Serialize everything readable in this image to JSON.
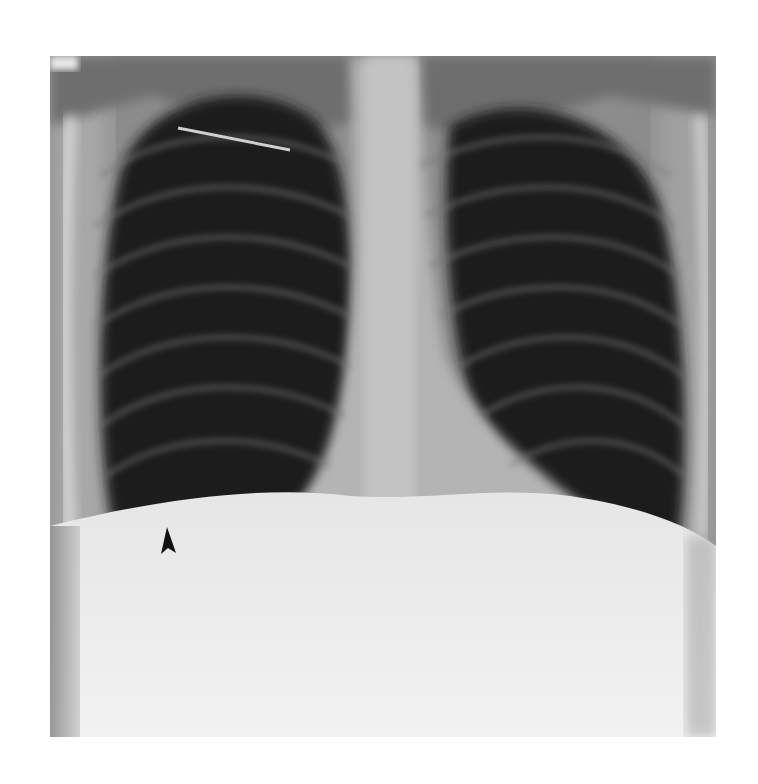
{
  "image": {
    "subject": "Frontal chest radiograph (PA view)",
    "features": [
      "right lung field",
      "left lung field",
      "mediastinum",
      "heart silhouette",
      "diaphragm",
      "catheter line",
      "arrowhead marker"
    ],
    "annotation": {
      "type": "arrowhead",
      "color": "#111111",
      "direction": "up"
    },
    "colors": {
      "background": "#ffffff",
      "lung": "#1e1e1e",
      "bone": "#d8d8d8",
      "abdomen": "#efefef"
    }
  }
}
